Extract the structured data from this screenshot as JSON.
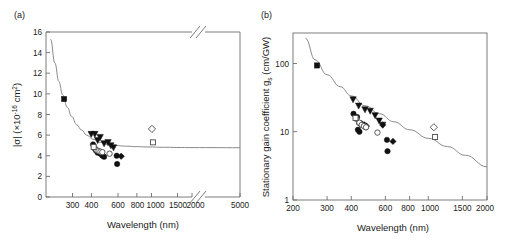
{
  "figure": {
    "panels": [
      {
        "id": "a",
        "label": "(a)",
        "xlabel": "Wavelength (nm)",
        "ylabel_parts": {
          "main": "|σ| (×10",
          "exponent": "-16",
          "tail": " cm",
          "sup2": "2",
          "close": ")"
        },
        "ylabel": "|σ| (×10⁻¹⁶ cm²)"
      },
      {
        "id": "b",
        "label": "(b)",
        "xlabel": "Wavelength (nm)",
        "ylabel_parts": {
          "main": "Stationary gain coefficient g",
          "sub": "s",
          "tail": " (cm/GW)"
        },
        "ylabel": "Stationary gain coefficient gₛ (cm/GW)"
      }
    ]
  },
  "chart_data": [
    {
      "type": "scatter",
      "panel": "a",
      "title": "(a)",
      "xlabel": "Wavelength (nm)",
      "ylabel": "|σ| (×10⁻¹⁶ cm²)",
      "xscale": "log-with-break",
      "yscale": "linear",
      "xlim": [
        200,
        5000
      ],
      "ylim": [
        0,
        16
      ],
      "axis_break": {
        "present": true,
        "between": [
          2000,
          5000
        ],
        "marks": [
          "top",
          "bottom"
        ]
      },
      "grid": false,
      "legend": "none",
      "xticks": [
        300,
        400,
        600,
        800,
        1000,
        1500,
        2000,
        5000
      ],
      "xtick_labels": [
        "300",
        "400",
        "600",
        "800",
        "1000",
        "1500",
        "2000",
        "5000"
      ],
      "yticks": [
        0,
        2,
        4,
        6,
        8,
        10,
        12,
        14,
        16
      ],
      "ytick_labels": [
        "0",
        "2",
        "4",
        "6",
        "8",
        "10",
        "12",
        "14",
        "16"
      ],
      "series": [
        {
          "name": "filled-square",
          "marker": "filled-square",
          "points": [
            [
              266,
              9.5
            ]
          ]
        },
        {
          "name": "filled-triangle-down",
          "marker": "filled-triangle-down",
          "points": [
            [
              408,
              6.1
            ],
            [
              432,
              6.1
            ],
            [
              452,
              5.5
            ],
            [
              470,
              5.8
            ],
            [
              500,
              5.2
            ],
            [
              532,
              5.3
            ],
            [
              556,
              5.0
            ],
            [
              580,
              4.8
            ]
          ]
        },
        {
          "name": "filled-circle",
          "marker": "filled-circle",
          "points": [
            [
              420,
              5.1
            ],
            [
              432,
              4.7
            ],
            [
              440,
              4.5
            ],
            [
              452,
              4.3
            ],
            [
              462,
              4.4
            ],
            [
              472,
              4.2
            ],
            [
              488,
              4.0
            ],
            [
              500,
              3.9
            ],
            [
              610,
              4.0
            ],
            [
              614,
              3.2
            ]
          ]
        },
        {
          "name": "filled-diamond",
          "marker": "filled-diamond",
          "points": [
            [
              440,
              4.6
            ],
            [
              462,
              4.3
            ],
            [
              478,
              4.1
            ],
            [
              655,
              3.95
            ]
          ]
        },
        {
          "name": "open-circle",
          "marker": "open-circle",
          "points": [
            [
              428,
              4.8
            ],
            [
              444,
              4.55
            ],
            [
              458,
              4.45
            ],
            [
              472,
              4.4
            ],
            [
              486,
              4.35
            ],
            [
              545,
              4.2
            ]
          ]
        },
        {
          "name": "open-square",
          "marker": "open-square",
          "points": [
            [
              424,
              4.85
            ],
            [
              1080,
              5.3
            ]
          ]
        },
        {
          "name": "open-diamond",
          "marker": "open-diamond",
          "points": [
            [
              1064,
              6.6
            ]
          ]
        }
      ],
      "fit_curve": {
        "description": "monotonic decaying curve, from ~15.3 at 215 nm to ~4.8 plateau at 5000 nm",
        "points": [
          [
            215,
            15.3
          ],
          [
            230,
            13.0
          ],
          [
            245,
            11.2
          ],
          [
            260,
            9.9
          ],
          [
            280,
            8.7
          ],
          [
            300,
            7.8
          ],
          [
            325,
            7.0
          ],
          [
            350,
            6.5
          ],
          [
            380,
            6.0
          ],
          [
            420,
            5.6
          ],
          [
            470,
            5.3
          ],
          [
            530,
            5.1
          ],
          [
            600,
            5.0
          ],
          [
            700,
            4.93
          ],
          [
            850,
            4.88
          ],
          [
            1000,
            4.85
          ],
          [
            1300,
            4.82
          ],
          [
            1700,
            4.8
          ],
          [
            2000,
            4.79
          ],
          [
            5000,
            4.78
          ]
        ]
      }
    },
    {
      "type": "scatter",
      "panel": "b",
      "title": "(b)",
      "xlabel": "Wavelength (nm)",
      "ylabel": "Stationary gain coefficient gₛ (cm/GW)",
      "xscale": "log",
      "yscale": "log",
      "xlim": [
        200,
        2000
      ],
      "ylim": [
        1,
        300
      ],
      "grid": false,
      "legend": "none",
      "xticks": [
        200,
        300,
        400,
        600,
        800,
        1000,
        1500,
        2000
      ],
      "xtick_labels": [
        "200",
        "300",
        "400",
        "600",
        "800",
        "1000",
        "1500",
        "2000"
      ],
      "yticks": [
        1,
        10,
        100
      ],
      "ytick_labels": [
        "1",
        "10",
        "100"
      ],
      "series": [
        {
          "name": "filled-square",
          "marker": "filled-square",
          "points": [
            [
              266,
              99
            ]
          ]
        },
        {
          "name": "filled-triangle-down",
          "marker": "filled-triangle-down",
          "points": [
            [
              408,
              31
            ],
            [
              436,
              25
            ],
            [
              470,
              22
            ],
            [
              500,
              21
            ],
            [
              530,
              18
            ],
            [
              556,
              15
            ],
            [
              580,
              13
            ]
          ]
        },
        {
          "name": "filled-circle",
          "marker": "filled-circle",
          "points": [
            [
              410,
              19
            ],
            [
              428,
              17
            ],
            [
              438,
              14
            ],
            [
              450,
              13
            ],
            [
              462,
              13
            ],
            [
              474,
              12
            ],
            [
              432,
              11
            ],
            [
              440,
              10.3
            ],
            [
              610,
              7.8
            ],
            [
              614,
              5.3
            ]
          ]
        },
        {
          "name": "filled-diamond",
          "marker": "filled-diamond",
          "points": [
            [
              452,
              13.5
            ],
            [
              466,
              13
            ],
            [
              478,
              12.5
            ],
            [
              580,
              13
            ],
            [
              655,
              7.4
            ]
          ]
        },
        {
          "name": "open-circle",
          "marker": "open-circle",
          "points": [
            [
              424,
              16
            ],
            [
              440,
              14
            ],
            [
              452,
              13
            ],
            [
              464,
              12.5
            ],
            [
              476,
              12
            ],
            [
              545,
              10
            ]
          ]
        },
        {
          "name": "open-square",
          "marker": "open-square",
          "points": [
            [
              420,
              16.5
            ],
            [
              1080,
              8.6
            ]
          ]
        },
        {
          "name": "open-diamond",
          "marker": "open-diamond",
          "points": [
            [
              1064,
              12
            ]
          ]
        }
      ],
      "fit_curve": {
        "description": "monotonic decreasing power-law-like curve from ~250 at 230 nm to ~3 at 2000 nm",
        "points": [
          [
            232,
            250
          ],
          [
            260,
            120
          ],
          [
            300,
            72
          ],
          [
            350,
            48
          ],
          [
            400,
            35
          ],
          [
            470,
            25
          ],
          [
            560,
            19
          ],
          [
            660,
            14.5
          ],
          [
            800,
            11
          ],
          [
            1000,
            8.2
          ],
          [
            1250,
            6.2
          ],
          [
            1550,
            4.6
          ],
          [
            2000,
            3.1
          ]
        ]
      }
    }
  ]
}
